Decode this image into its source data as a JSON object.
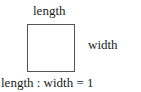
{
  "diagram": {
    "top_label": "length",
    "side_label": "width",
    "ratio_label": "length : width = 1",
    "shape": "square"
  }
}
